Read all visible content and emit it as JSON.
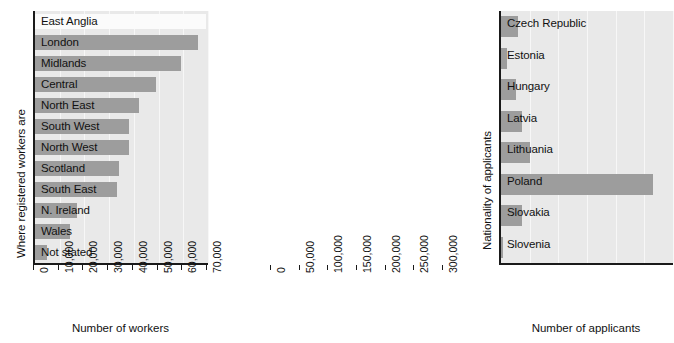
{
  "figure": {
    "panels": [
      "left",
      "right"
    ]
  },
  "chart_data": [
    {
      "type": "bar",
      "orientation": "horizontal",
      "id": "workers-by-region",
      "title": "",
      "xlabel": "Number of workers",
      "ylabel": "Where registered workers are",
      "xlim": [
        0,
        70000
      ],
      "xticks": [
        0,
        10000,
        20000,
        30000,
        40000,
        50000,
        60000,
        70000
      ],
      "xticklabels": [
        "0",
        "10,000",
        "20,000",
        "30,000",
        "40,000",
        "50,000",
        "60,000",
        "70,000"
      ],
      "grid": true,
      "legend": "none",
      "bar_color": "#9d9d9d",
      "highlight_color": "#fbfbfb",
      "categories": [
        "East Anglia",
        "London",
        "Midlands",
        "Central",
        "North East",
        "South West",
        "North West",
        "Scotland",
        "South East",
        "N. Ireland",
        "Wales",
        "Not stated"
      ],
      "values": [
        69000,
        66000,
        59000,
        49000,
        42000,
        38000,
        38000,
        34000,
        33000,
        17000,
        14000,
        5000
      ],
      "highlighted": [
        "East Anglia"
      ]
    },
    {
      "type": "bar",
      "orientation": "horizontal",
      "id": "applicants-by-nationality",
      "title": "",
      "xlabel": "Number of applicants",
      "ylabel": "Nationality of applicants",
      "xlim": [
        0,
        300000
      ],
      "xticks": [
        0,
        50000,
        100000,
        150000,
        200000,
        250000,
        300000
      ],
      "xticklabels": [
        "0",
        "50,000",
        "100,000",
        "150,000",
        "200,000",
        "250,000",
        "300,000"
      ],
      "grid": true,
      "legend": "none",
      "bar_color": "#9d9d9d",
      "categories": [
        "Czech Republic",
        "Estonia",
        "Hungary",
        "Latvia",
        "Lithuania",
        "Poland",
        "Slovakia",
        "Slovenia"
      ],
      "values": [
        29000,
        10000,
        26000,
        36000,
        50000,
        265000,
        36000,
        3000
      ],
      "highlighted": []
    }
  ]
}
